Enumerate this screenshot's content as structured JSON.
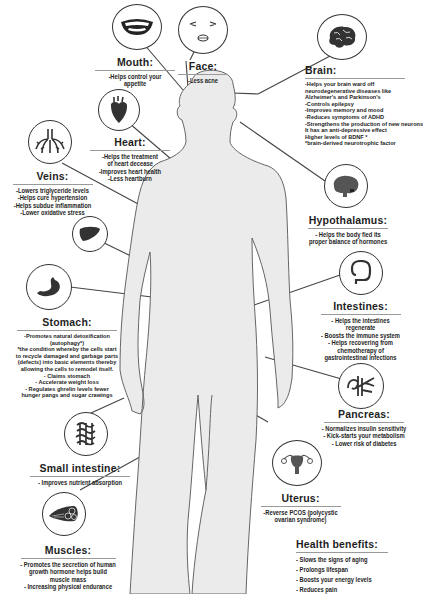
{
  "colors": {
    "silhouette": "#ebebeb",
    "silhouette_outline": "#555555",
    "line": "#444444",
    "icon_fill": "#4a4a4a",
    "text": "#1e1e1e"
  },
  "organs": {
    "mouth": {
      "icon": "mouth-smile-icon",
      "title": "Mouth:",
      "items": [
        "-Helps control your",
        "appetite"
      ]
    },
    "face": {
      "icon": "face-icon",
      "title": "Face:",
      "items": [
        "-Less acne"
      ]
    },
    "brain": {
      "icon": "brain-icon",
      "title": "Brain:",
      "items": [
        "-Helps your brain ward off",
        "neurodegenerative diseases like",
        "Alzheimer's and Parkinson's",
        "-Controls epilepsy",
        "-Improves memory and mood",
        "-Reduces symptoms of ADHD",
        "-Strengthens the production of new neurons",
        "It has an anti-depressive effect",
        "Higher levels of BDNF *",
        "*brain-derived neurotrophic factor"
      ]
    },
    "heart": {
      "icon": "heart-organ-icon",
      "title": "Heart:",
      "items": [
        "-Helps the treatment",
        "of heart decease",
        "-Improves heart health",
        "-Less heartburn"
      ]
    },
    "veins": {
      "icon": "veins-icon",
      "title": "Veins:",
      "items": [
        "-Lowers triglyceride levels",
        "-Helps cure hypertension",
        "-Helps subdue inflammation",
        "-Lower oxidative stress"
      ]
    },
    "liver": {
      "icon": "liver-icon"
    },
    "hypothalamus": {
      "icon": "hypothalamus-brain-icon",
      "title": "Hypothalamus:",
      "items": [
        "- Helps the body fied its",
        "proper balance of hormones"
      ]
    },
    "stomach": {
      "icon": "stomach-icon",
      "title": "Stomach:",
      "items": [
        "-Promotes natural detoxification",
        "(autophagy*)",
        "*the condition whereby the cells start",
        "to recycle damaged and garbage parts",
        "(defects) into basic elements thereby",
        "allowing the cells to remodel itself.",
        "- Claims stomach",
        "- Accelerate weight loss",
        "- Regulates ghrelin levels fewer",
        "hunger pangs and sugar crawings"
      ]
    },
    "intestines": {
      "icon": "intestines-icon",
      "title": "Intestines:",
      "items": [
        "- Helps the intestines",
        "regenerate",
        "- Boosts the immune system",
        "- Helps recovering from",
        "chemotherapy of",
        "gastrointestinal infections"
      ]
    },
    "pancreas": {
      "icon": "pancreas-icon",
      "title": "Pancreas:",
      "items": [
        "- Normalizes insulin sensitivity",
        "- Kick-starts your metabolism",
        "- Lower risk of diabetes"
      ]
    },
    "small_intestine": {
      "icon": "small-intestine-icon",
      "title": "Small intestine:",
      "items": [
        "- Improves nutrient absorption"
      ]
    },
    "uterus": {
      "icon": "uterus-icon",
      "title": "Uterus:",
      "items": [
        "-Reverse PCOS (polycystic",
        "ovarian syndrome)"
      ]
    },
    "muscles": {
      "icon": "muscle-fiber-icon",
      "title": "Muscles:",
      "items": [
        "- Promotes the secretion of human",
        "growth hormone     helps build",
        "muscle mass",
        "- Increasing physical endurance"
      ]
    }
  },
  "health_benefits": {
    "title": "Health benefits:",
    "items": [
      "- Slows the signs of aging",
      "- Prolongs lifespan",
      "- Boosts your energy levels",
      "- Reduces pain"
    ]
  }
}
